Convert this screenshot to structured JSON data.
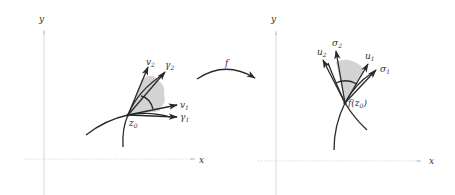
{
  "figure": {
    "left_panel": {
      "axis_x_label": "x",
      "axis_y_label": "y",
      "point_label": "z",
      "point_sub": "0",
      "vectors": [
        {
          "name": "v",
          "sub": "2"
        },
        {
          "name": "γ",
          "sub": "2"
        },
        {
          "name": "v",
          "sub": "1"
        },
        {
          "name": "γ",
          "sub": "1"
        }
      ]
    },
    "map_label": "f",
    "right_panel": {
      "axis_x_label": "x",
      "axis_y_label": "y",
      "point_label_prefix": "f(z",
      "point_sub": "0",
      "point_label_suffix": ")",
      "vectors": [
        {
          "name": "u",
          "sub": "2"
        },
        {
          "name": "σ",
          "sub": "2"
        },
        {
          "name": "u",
          "sub": "1"
        },
        {
          "name": "σ",
          "sub": "1"
        }
      ]
    },
    "colors": {
      "ink": "#2a2a2a",
      "axis": "#cfcfcf",
      "shade": "#d3d3d3"
    }
  }
}
